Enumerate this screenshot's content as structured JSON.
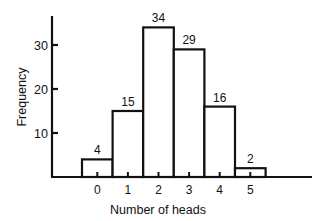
{
  "chart_data": {
    "type": "bar",
    "title": "",
    "xlabel": "Number of heads",
    "ylabel": "Frequency",
    "categories": [
      "0",
      "1",
      "2",
      "3",
      "4",
      "5"
    ],
    "values": [
      4,
      15,
      34,
      29,
      16,
      2
    ],
    "data_labels": [
      "4",
      "15",
      "34",
      "29",
      "16",
      "2"
    ],
    "yticks": [
      10,
      20,
      30
    ],
    "ylim": [
      0,
      36
    ],
    "grid": false,
    "legend": null,
    "style": "histogram (adjacent outlined bars)"
  },
  "axis": {
    "xlabel": "Number of heads",
    "ylabel": "Frequency",
    "ytick_labels": [
      "10",
      "20",
      "30"
    ],
    "xtick_labels": [
      "0",
      "1",
      "2",
      "3",
      "4",
      "5"
    ]
  },
  "colors": {
    "bar_fill": "#ffffff",
    "stroke": "#111111",
    "background": "#ffffff"
  }
}
